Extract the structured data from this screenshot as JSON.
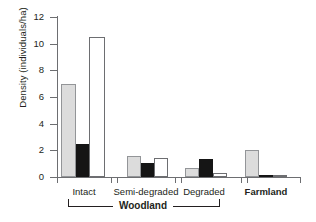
{
  "chart_data": {
    "type": "bar",
    "title": "",
    "xlabel": "",
    "ylabel": "Density (individuals/ha)",
    "ylim": [
      0,
      12
    ],
    "yticks": [
      0,
      2,
      4,
      6,
      8,
      10,
      12
    ],
    "ytick_labels": [
      "0",
      "2",
      "4",
      "6",
      "8",
      "10",
      "12"
    ],
    "grid": false,
    "legend": "none",
    "categories": [
      "Intact",
      "Semi-degraded",
      "Degraded",
      "Farmland"
    ],
    "series": [
      {
        "name": "gray",
        "color": "#dcdcdc",
        "values": [
          7.0,
          1.6,
          0.65,
          2.0
        ]
      },
      {
        "name": "black",
        "color": "#151515",
        "values": [
          2.5,
          1.05,
          1.35,
          0.1
        ]
      },
      {
        "name": "white",
        "color": "#ffffff",
        "values": [
          10.5,
          1.4,
          0.3,
          0.15
        ]
      }
    ],
    "group_bracket": {
      "label": "Woodland",
      "spans": [
        "Intact",
        "Semi-degraded",
        "Degraded"
      ]
    }
  },
  "axis": {
    "y_title": "Density (individuals/ha)",
    "ticks": [
      {
        "label": "12",
        "value": 12
      },
      {
        "label": "10",
        "value": 10
      },
      {
        "label": "8",
        "value": 8
      },
      {
        "label": "6",
        "value": 6
      },
      {
        "label": "4",
        "value": 4
      },
      {
        "label": "2",
        "value": 2
      },
      {
        "label": "0",
        "value": 0
      }
    ]
  },
  "categories": [
    {
      "label": "Intact",
      "bold": false
    },
    {
      "label": "Semi-degraded",
      "bold": false
    },
    {
      "label": "Degraded",
      "bold": false
    },
    {
      "label": "Farmland",
      "bold": true
    }
  ],
  "bracket": {
    "label": "Woodland"
  }
}
